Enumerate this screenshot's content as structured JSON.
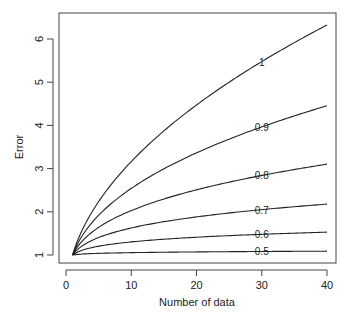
{
  "chart_data": {
    "type": "line",
    "title": "",
    "xlabel": "Number of data",
    "ylabel": "Error",
    "xlim": [
      0,
      40
    ],
    "ylim": [
      1,
      6.4
    ],
    "x_ticks": [
      "0",
      "10",
      "20",
      "30",
      "40"
    ],
    "y_ticks": [
      "1",
      "2",
      "3",
      "4",
      "5",
      "6"
    ],
    "grid": false,
    "legend": "inline curve labels at x=30",
    "x": [
      1,
      2,
      3,
      4,
      5,
      6,
      8,
      10,
      12,
      15,
      18,
      20,
      22,
      25,
      28,
      30,
      32,
      35,
      38,
      40
    ],
    "series": [
      {
        "name": "1",
        "exponent": 0.5,
        "end_value": 6.39
      },
      {
        "name": "0.9",
        "exponent": 0.405,
        "end_value": 4.45
      },
      {
        "name": "0.8",
        "exponent": 0.307,
        "end_value": 3.1
      },
      {
        "name": "0.7",
        "exponent": 0.211,
        "end_value": 2.18
      },
      {
        "name": "0.6",
        "exponent": 0.115,
        "end_value": 1.53
      },
      {
        "name": "0.5",
        "exponent": 0.023,
        "end_value": 1.09
      }
    ],
    "label_x": 30
  },
  "colors": {
    "line": "#222222",
    "axis": "#333333"
  }
}
